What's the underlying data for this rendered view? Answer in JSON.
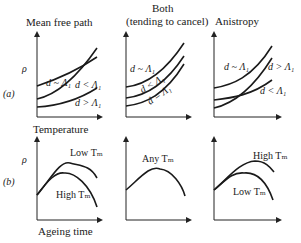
{
  "columns": [
    {
      "title": "Mean free path"
    },
    {
      "title": "Both",
      "subtitle": "(tending to cancel)"
    },
    {
      "title": "Anistropy"
    }
  ],
  "rows": {
    "a": {
      "label": "(a)",
      "y_axis": "ρ",
      "x_axis": "Temperature"
    },
    "b": {
      "label": "(b)",
      "y_axis": "ρ",
      "x_axis": "Ageing time"
    }
  },
  "panels": {
    "a1": {
      "curves": [
        "d ~ Λ₁",
        "d < Λ₁",
        "d > Λ₁"
      ]
    },
    "a2": {
      "curves": [
        "d ~ Λ₁",
        "d < Λ₁",
        "d = Λ₁"
      ]
    },
    "a3": {
      "curves": [
        "d ~ Λ₁",
        "d > Λ₁",
        "d < Λ₁"
      ]
    },
    "b1": {
      "curves": [
        "Low Tₘ",
        "High Tₘ"
      ]
    },
    "b2": {
      "curves": [
        "Any Tₘ"
      ]
    },
    "b3": {
      "curves": [
        "High Tₘ",
        "Low Tₘ"
      ]
    }
  }
}
